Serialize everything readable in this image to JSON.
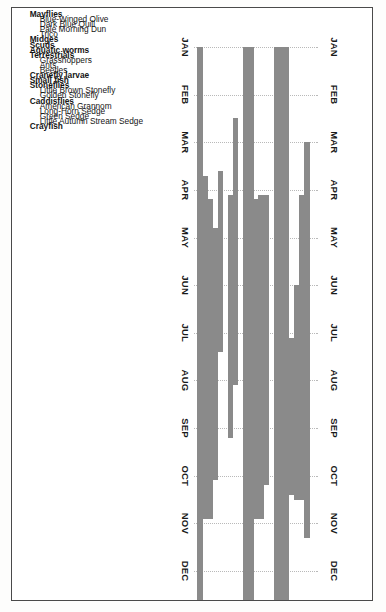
{
  "chart_data": {
    "type": "bar",
    "orientation": "horizontal-range",
    "title": "",
    "subtitle": "",
    "xlabel": "",
    "ylabel": "",
    "grid": true,
    "legend": null,
    "axis_months": [
      "JAN",
      "FEB",
      "MAR",
      "APR",
      "MAY",
      "JUN",
      "JUL",
      "AUG",
      "SEP",
      "OCT",
      "NOV",
      "DEC"
    ],
    "axis_top_months": [
      "JAN",
      "FEB",
      "MAR",
      "APR",
      "MAY",
      "JUN",
      "JUL",
      "AUG",
      "SEP",
      "OCT",
      "NOV",
      "DEC"
    ],
    "axis_bottom_months": [
      "JAN",
      "FEB",
      "MAR",
      "APR",
      "MAY",
      "JUN",
      "JUL",
      "AUG",
      "SEP",
      "OCT",
      "NOV",
      "DEC"
    ],
    "xlim": [
      1,
      12
    ],
    "categories": [
      {
        "label": "Mayflies",
        "kind": "group",
        "start": null,
        "end": null
      },
      {
        "label": "Blue-Winged Olive",
        "kind": "child",
        "start": 3.0,
        "end": 11.3
      },
      {
        "label": "Dark Blue Quill",
        "kind": "child",
        "start": 4.1,
        "end": 10.5
      },
      {
        "label": "Pale Morning Dun",
        "kind": "child",
        "start": 6.0,
        "end": 10.5
      },
      {
        "label": "Trico",
        "kind": "child",
        "start": 7.1,
        "end": 10.4
      },
      {
        "label": "Midges",
        "kind": "group",
        "start": 1.0,
        "end": 12.6
      },
      {
        "label": "Scuds",
        "kind": "group",
        "start": 1.0,
        "end": 12.6
      },
      {
        "label": "Aquatic worms",
        "kind": "group",
        "start": 1.0,
        "end": 12.6
      },
      {
        "label": "Terrestrials",
        "kind": "group",
        "start": null,
        "end": null
      },
      {
        "label": "Grasshoppers",
        "kind": "child",
        "start": 4.1,
        "end": 10.2
      },
      {
        "label": "Ants",
        "kind": "child",
        "start": 4.1,
        "end": 10.9
      },
      {
        "label": "Beetles",
        "kind": "child",
        "start": 4.2,
        "end": 10.9
      },
      {
        "label": "Cranefly larvae",
        "kind": "group",
        "start": 1.0,
        "end": 12.6
      },
      {
        "label": "Small fish",
        "kind": "group",
        "start": 1.0,
        "end": 12.6
      },
      {
        "label": "Stoneflies",
        "kind": "group",
        "start": null,
        "end": null
      },
      {
        "label": "Little Brown Stonefly",
        "kind": "child",
        "start": 2.5,
        "end": 8.1
      },
      {
        "label": "Golden Stonefly",
        "kind": "child",
        "start": 4.1,
        "end": 9.2
      },
      {
        "label": "Caddisflies",
        "kind": "group",
        "start": null,
        "end": null
      },
      {
        "label": "American Grannom",
        "kind": "child",
        "start": 3.6,
        "end": 7.4
      },
      {
        "label": "Long-Horn Sedge",
        "kind": "child",
        "start": 4.8,
        "end": 10.1
      },
      {
        "label": "Green Sedge",
        "kind": "child",
        "start": 4.2,
        "end": 10.9
      },
      {
        "label": "Little Autumn Stream Sedge",
        "kind": "child",
        "start": 3.7,
        "end": 10.9
      },
      {
        "label": "Crayfish",
        "kind": "group",
        "start": 1.0,
        "end": 12.6
      }
    ]
  },
  "colors": {
    "bar": "#8a8a8a",
    "grid": "#b9b9b9",
    "border": "#4a4a4a",
    "text": "#151515",
    "background": "#ffffff"
  }
}
